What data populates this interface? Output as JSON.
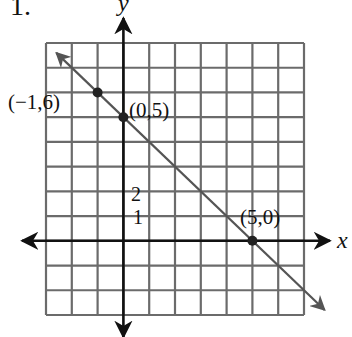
{
  "problem": {
    "number": "1."
  },
  "axes": {
    "x_label": "x",
    "y_label": "y"
  },
  "tick_labels": [
    {
      "text": "2",
      "value": 2
    },
    {
      "text": "1",
      "value": 1
    }
  ],
  "points": [
    {
      "label": "(−1,6)",
      "x": -1,
      "y": 6
    },
    {
      "label": "(0,5)",
      "x": 0,
      "y": 5
    },
    {
      "label": "(5,0)",
      "x": 5,
      "y": 0
    }
  ],
  "colors": {
    "grid": "#6b6b6b",
    "axis": "#111111",
    "line": "#555555",
    "point": "#222222"
  },
  "chart_data": {
    "type": "line",
    "title": "1.",
    "xlabel": "x",
    "ylabel": "y",
    "xlim": [
      -3,
      7
    ],
    "ylim": [
      -3,
      8
    ],
    "grid": true,
    "legend": null,
    "series": [
      {
        "name": "y = -x + 5",
        "x": [
          -1,
          0,
          5
        ],
        "y": [
          6,
          5,
          0
        ],
        "slope": -1,
        "intercept": 5,
        "arrows": "both"
      }
    ],
    "annotations": [
      "(−1,6)",
      "(0,5)",
      "(5,0)",
      "2",
      "1"
    ],
    "tick_labels": {
      "y": [
        "1",
        "2"
      ]
    }
  }
}
